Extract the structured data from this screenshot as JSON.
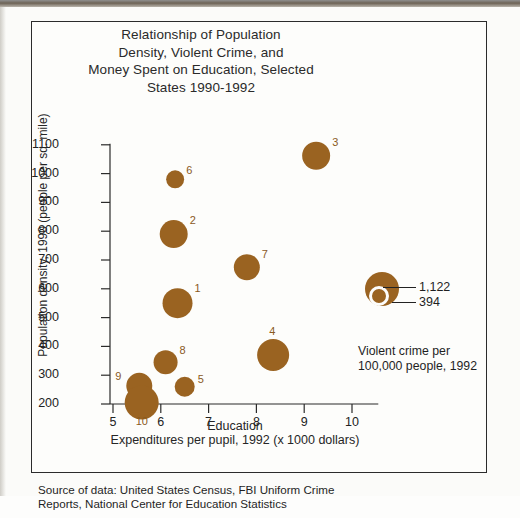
{
  "title": "Relationship of Population Density, Violent Crime, and Money Spent on Education, Selected States 1990-1992",
  "title_lines": [
    "Relationship of Population",
    "Density, Violent Crime, and",
    "Money Spent on Education, Selected",
    "States 1990-1992"
  ],
  "source_lines": [
    "Source of data: United States Census, FBI Uniform Crime",
    "Reports, National Center for Education Statistics"
  ],
  "annotation": {
    "line1": "Violent crime per",
    "line2": "100,000 people, 1992",
    "points_to": "4"
  },
  "size_legend": {
    "large_value": "1,122",
    "small_value": "394"
  },
  "legend": {
    "items": [
      {
        "num": "1.",
        "label": "Maryland"
      },
      {
        "num": "2.",
        "label": "Massachusetts"
      },
      {
        "num": "3.",
        "label": "New Jersey"
      },
      {
        "num": "4.",
        "label": "New York"
      },
      {
        "num": "5.",
        "label": "Pennsylvania"
      },
      {
        "num": "6.",
        "label": "Rhode Island"
      },
      {
        "num": "7.",
        "label": "Connecticut"
      },
      {
        "num": "8.",
        "label": "Delaware"
      },
      {
        "num": "9.",
        "label": "Ohio"
      },
      {
        "num": "10.",
        "label": "Illinois"
      }
    ]
  },
  "colors": {
    "bubble": "#9a6321",
    "bubble_label": "#8a5a1e",
    "axis": "#2b2b2b",
    "text": "#1f1f1f",
    "page": "#fdfdfb"
  },
  "chart_data": {
    "type": "scatter",
    "title": "Relationship of Population Density, Violent Crime, and Money Spent on Education, Selected States 1990-1992",
    "xlabel": "Education Expenditures per pupil, 1992 (x 1000 dollars)",
    "xlabel_line1": "Education",
    "xlabel_line2": "Expenditures per  pupil, 1992 (x 1000 dollars)",
    "ylabel": "Population density, 1990 (people per sq. mile)",
    "xlim": [
      5,
      10.6
    ],
    "ylim": [
      180,
      1130
    ],
    "xticks": [
      "5",
      "6",
      "7",
      "8",
      "9",
      "10"
    ],
    "yticks": [
      "200",
      "300",
      "400",
      "500",
      "600",
      "700",
      "800",
      "900",
      "1000",
      "1100"
    ],
    "grid": false,
    "legend_position": "right",
    "size_encoding": "Violent crime per 100,000 people, 1992",
    "size_legend_values": [
      1122,
      394
    ],
    "points": [
      {
        "label": "1",
        "state": "Maryland",
        "x": 6.35,
        "y": 550,
        "r": 15
      },
      {
        "label": "2",
        "state": "Massachusetts",
        "x": 6.27,
        "y": 790,
        "r": 14
      },
      {
        "label": "3",
        "state": "New Jersey",
        "x": 9.25,
        "y": 1062,
        "r": 14
      },
      {
        "label": "4",
        "state": "New York",
        "x": 8.35,
        "y": 370,
        "r": 16
      },
      {
        "label": "5",
        "state": "Pennsylvania",
        "x": 6.5,
        "y": 260,
        "r": 10
      },
      {
        "label": "6",
        "state": "Rhode Island",
        "x": 6.3,
        "y": 980,
        "r": 9
      },
      {
        "label": "7",
        "state": "Connecticut",
        "x": 7.8,
        "y": 675,
        "r": 13
      },
      {
        "label": "8",
        "state": "Delaware",
        "x": 6.1,
        "y": 345,
        "r": 12
      },
      {
        "label": "9",
        "state": "Ohio",
        "x": 5.55,
        "y": 263,
        "r": 13
      },
      {
        "label": "10",
        "state": "Illinois",
        "x": 5.6,
        "y": 205,
        "r": 17
      }
    ]
  }
}
